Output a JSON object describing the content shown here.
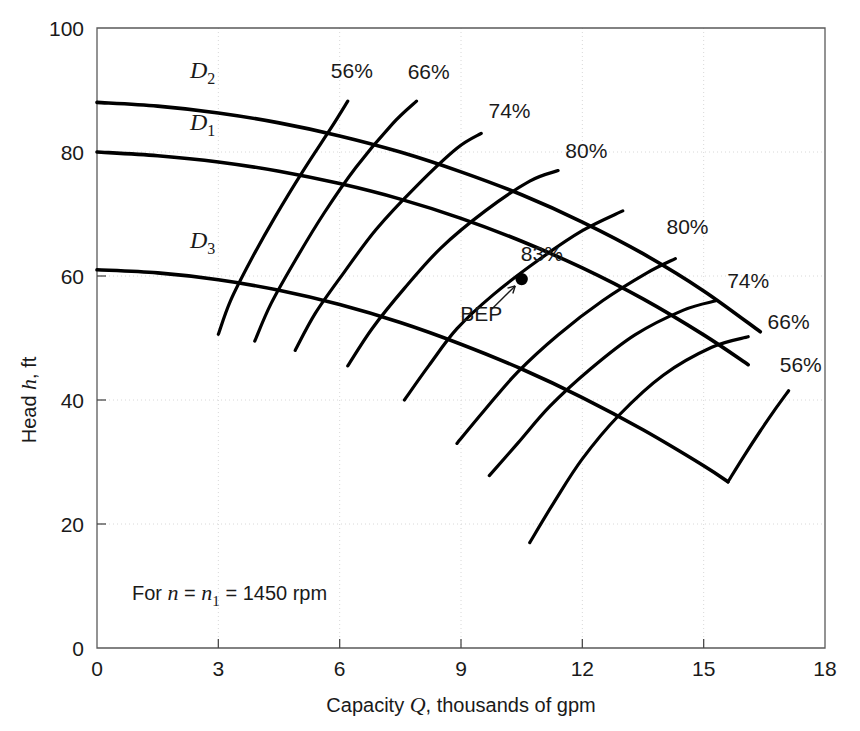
{
  "chart_data": {
    "type": "line",
    "title": "",
    "xlabel": "Capacity Q, thousands of gpm",
    "ylabel": "Head h, ft",
    "xlim": [
      0,
      18
    ],
    "ylim": [
      0,
      100
    ],
    "xticks": [
      "0",
      "3",
      "6",
      "9",
      "12",
      "15",
      "18"
    ],
    "xtick_values": [
      0,
      3,
      6,
      9,
      12,
      15,
      18
    ],
    "yticks": [
      "0",
      "20",
      "40",
      "60",
      "80",
      "100"
    ],
    "ytick_values": [
      0,
      20,
      40,
      60,
      80,
      100
    ],
    "grid": true,
    "legend_position": "inline-annotations",
    "note": "For n = n1 = 1450 rpm",
    "note_parts": {
      "prefix": "For ",
      "var1": "n",
      "eq1": " = ",
      "var2": "n",
      "var2_sub": "1",
      "eq2": " = ",
      "value": "1450 rpm"
    },
    "series": [
      {
        "name": "D2",
        "label": "D",
        "label_sub": "2",
        "label_x": 2.3,
        "label_y": 92.0,
        "points": [
          [
            0.0,
            88.0
          ],
          [
            1.5,
            87.4
          ],
          [
            3.0,
            86.3
          ],
          [
            4.5,
            84.7
          ],
          [
            6.0,
            82.6
          ],
          [
            7.5,
            80.0
          ],
          [
            9.0,
            76.8
          ],
          [
            10.5,
            73.1
          ],
          [
            12.0,
            68.7
          ],
          [
            13.5,
            63.6
          ],
          [
            15.0,
            57.6
          ],
          [
            16.4,
            51.0
          ]
        ]
      },
      {
        "name": "D1",
        "label": "D",
        "label_sub": "1",
        "label_x": 2.3,
        "label_y": 83.5,
        "points": [
          [
            0.0,
            80.0
          ],
          [
            1.5,
            79.4
          ],
          [
            3.0,
            78.4
          ],
          [
            4.5,
            76.9
          ],
          [
            6.0,
            74.9
          ],
          [
            7.5,
            72.4
          ],
          [
            9.0,
            69.3
          ],
          [
            10.5,
            65.6
          ],
          [
            12.0,
            61.3
          ],
          [
            13.5,
            56.3
          ],
          [
            15.0,
            50.5
          ],
          [
            16.1,
            45.7
          ]
        ]
      },
      {
        "name": "D3",
        "label": "D",
        "label_sub": "3",
        "label_x": 2.3,
        "label_y": 64.5,
        "points": [
          [
            0.0,
            61.0
          ],
          [
            1.5,
            60.5
          ],
          [
            3.0,
            59.4
          ],
          [
            4.5,
            57.7
          ],
          [
            6.0,
            55.4
          ],
          [
            7.5,
            52.5
          ],
          [
            9.0,
            49.0
          ],
          [
            10.5,
            45.0
          ],
          [
            12.0,
            40.4
          ],
          [
            13.5,
            35.2
          ],
          [
            15.0,
            29.4
          ],
          [
            15.6,
            26.8
          ]
        ]
      }
    ],
    "efficiency_curves": [
      {
        "name": "eff-56-left",
        "label": "56%",
        "label_x": 6.3,
        "label_y": 92.0,
        "points": [
          [
            3.0,
            50.6
          ],
          [
            3.3,
            56.0
          ],
          [
            3.8,
            62.5
          ],
          [
            4.4,
            69.5
          ],
          [
            5.1,
            77.0
          ],
          [
            5.8,
            84.0
          ],
          [
            6.2,
            88.2
          ]
        ]
      },
      {
        "name": "eff-66-left",
        "label": "66%",
        "label_x": 8.2,
        "label_y": 91.8,
        "points": [
          [
            3.9,
            49.5
          ],
          [
            4.3,
            55.5
          ],
          [
            4.9,
            62.5
          ],
          [
            5.6,
            70.0
          ],
          [
            6.4,
            77.5
          ],
          [
            7.3,
            84.5
          ],
          [
            7.9,
            88.2
          ]
        ]
      },
      {
        "name": "eff-74-left",
        "label": "74%",
        "label_x": 10.2,
        "label_y": 85.5,
        "points": [
          [
            4.9,
            48.0
          ],
          [
            5.4,
            54.0
          ],
          [
            6.1,
            60.5
          ],
          [
            6.9,
            67.5
          ],
          [
            7.9,
            74.5
          ],
          [
            8.9,
            80.6
          ],
          [
            9.5,
            83.0
          ]
        ]
      },
      {
        "name": "eff-80-left",
        "label": "80%",
        "label_x": 12.1,
        "label_y": 79.0,
        "points": [
          [
            6.2,
            45.5
          ],
          [
            6.8,
            51.5
          ],
          [
            7.6,
            58.0
          ],
          [
            8.5,
            64.5
          ],
          [
            9.6,
            70.5
          ],
          [
            10.7,
            75.3
          ],
          [
            11.4,
            77.0
          ]
        ]
      },
      {
        "name": "eff-83-bep",
        "label": "83%",
        "label_x": 11.0,
        "label_y": 62.5,
        "points": [
          [
            7.6,
            40.0
          ],
          [
            8.2,
            45.5
          ],
          [
            8.9,
            51.5
          ],
          [
            9.8,
            57.0
          ],
          [
            10.9,
            62.5
          ],
          [
            12.0,
            67.3
          ],
          [
            13.0,
            70.5
          ]
        ]
      },
      {
        "name": "eff-80-right",
        "label": "80%",
        "label_x": 14.6,
        "label_y": 66.8,
        "points": [
          [
            8.9,
            33.0
          ],
          [
            9.6,
            38.5
          ],
          [
            10.4,
            44.5
          ],
          [
            11.4,
            50.5
          ],
          [
            12.5,
            56.0
          ],
          [
            13.6,
            60.5
          ],
          [
            14.3,
            62.8
          ]
        ]
      },
      {
        "name": "eff-74-right",
        "label": "74%",
        "label_x": 16.1,
        "label_y": 58.0,
        "points": [
          [
            9.7,
            27.8
          ],
          [
            10.4,
            33.0
          ],
          [
            11.2,
            39.0
          ],
          [
            12.2,
            45.0
          ],
          [
            13.3,
            50.5
          ],
          [
            14.5,
            54.5
          ],
          [
            15.3,
            56.0
          ]
        ]
      },
      {
        "name": "eff-66-right",
        "label": "66%",
        "label_x": 17.1,
        "label_y": 51.5,
        "points": [
          [
            10.7,
            17.0
          ],
          [
            11.3,
            23.5
          ],
          [
            12.0,
            30.5
          ],
          [
            12.9,
            37.5
          ],
          [
            14.0,
            44.0
          ],
          [
            15.2,
            48.5
          ],
          [
            16.1,
            50.2
          ]
        ]
      },
      {
        "name": "eff-56-right",
        "label": "56%",
        "label_x": 17.4,
        "label_y": 44.5,
        "points": [
          [
            15.6,
            26.8
          ],
          [
            16.0,
            31.0
          ],
          [
            16.4,
            35.0
          ],
          [
            16.8,
            38.8
          ],
          [
            17.1,
            41.5
          ]
        ]
      }
    ],
    "bep": {
      "label": "83%",
      "annotation": "BEP",
      "x": 10.5,
      "y": 59.5,
      "annotation_x": 9.5,
      "annotation_y": 52.8,
      "arrow_from_x": 9.75,
      "arrow_from_y": 54.6,
      "arrow_to_x": 10.34,
      "arrow_to_y": 58.4
    },
    "colors": {
      "curve": "#000000",
      "axis": "#5a5a5a",
      "grid": "#d8d8d8",
      "text": "#1a1a1a",
      "background": "#ffffff"
    }
  }
}
